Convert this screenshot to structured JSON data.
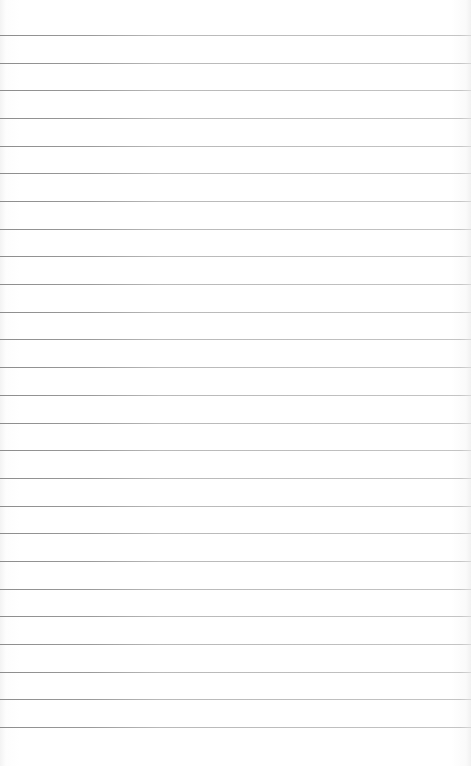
{
  "page": {
    "type": "ruled-paper",
    "background_color": "#ffffff",
    "line_color": "#bdbdbd",
    "line_count": 26,
    "first_line_y": 35,
    "line_spacing": 27.68
  }
}
